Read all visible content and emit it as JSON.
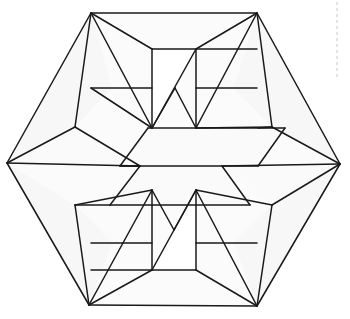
{
  "figure": {
    "type": "geometric-line-figure",
    "canvas": {
      "width": 350,
      "height": 319,
      "background": "#ffffff"
    },
    "stroke_color": "#1a1a1a",
    "stroke_width": 1.5,
    "fill_color": "#fbfbfb",
    "guide_color": "#c9c9c9",
    "outer_hexagon": [
      [
        91,
        13
      ],
      [
        257,
        13
      ],
      [
        340,
        164
      ],
      [
        257,
        306
      ],
      [
        89,
        305
      ],
      [
        7,
        163
      ]
    ],
    "center_band": [
      [
        120,
        166
      ],
      [
        148,
        128
      ],
      [
        285,
        128
      ],
      [
        258,
        166
      ],
      [
        222,
        166
      ],
      [
        250,
        205
      ],
      [
        110,
        205
      ],
      [
        140,
        166
      ]
    ],
    "guide_dashes": [
      {
        "x1": 337,
        "y1": 2,
        "x2": 337,
        "y2": 80
      }
    ],
    "faces": [
      {
        "id": "top-left-wing",
        "shade": "shade-a",
        "points": "91,13 7,163 75,127 112,88"
      },
      {
        "id": "top-right-wing",
        "shade": "shade-a",
        "points": "257,13 340,164 272,127 234,88"
      },
      {
        "id": "bottom-left-wing",
        "shade": "shade-a",
        "points": "89,305 7,163 75,205 112,243"
      },
      {
        "id": "bottom-right-wing",
        "shade": "shade-a",
        "points": "257,306 340,164 272,205 234,243"
      },
      {
        "id": "upper-center-band",
        "shade": "shade-b",
        "points": "148,128 285,128 258,166 120,166"
      },
      {
        "id": "lower-center-band",
        "shade": "shade-b",
        "points": "110,205 250,205 222,166 140,166"
      },
      {
        "id": "left-arrow",
        "shade": "shade-b",
        "points": "7,163 75,127 140,166"
      },
      {
        "id": "right-arrow",
        "shade": "shade-b",
        "points": "340,164 272,205 222,166"
      },
      {
        "id": "top-zig-left",
        "shade": "shade-c",
        "points": "152,49 152,128 196,49"
      },
      {
        "id": "bottom-zig-right",
        "shade": "shade-c",
        "points": "196,270 196,190 152,270"
      }
    ],
    "lines": [
      {
        "id": "outer-edge-nw",
        "d": "M 91,13 L 7,163"
      },
      {
        "id": "outer-edge-n",
        "d": "M 91,13 L 257,13"
      },
      {
        "id": "outer-edge-ne",
        "d": "M 257,13 L 340,164"
      },
      {
        "id": "outer-edge-se",
        "d": "M 340,164 L 257,306"
      },
      {
        "id": "outer-edge-s",
        "d": "M 257,306 L 89,305"
      },
      {
        "id": "outer-edge-sw",
        "d": "M 89,305 L 7,163"
      },
      {
        "id": "tl-fold-a",
        "d": "M 91,13 L 75,127"
      },
      {
        "id": "tl-fold-b",
        "d": "M 91,13 L 152,128"
      },
      {
        "id": "tl-fold-c",
        "d": "M 91,13 L 152,49"
      },
      {
        "id": "tl-shelf",
        "d": "M 91,88 L 152,88"
      },
      {
        "id": "tl-diag",
        "d": "M 91,88 L 152,128"
      },
      {
        "id": "left-arrow-top",
        "d": "M 7,163 L 75,127"
      },
      {
        "id": "left-arrow-bottom",
        "d": "M 75,127 L 140,166"
      },
      {
        "id": "left-mid-horizontal",
        "d": "M 7,163 L 140,166"
      },
      {
        "id": "tr-fold-a",
        "d": "M 257,13 L 272,127"
      },
      {
        "id": "tr-fold-b",
        "d": "M 257,13 L 196,128"
      },
      {
        "id": "tr-fold-c",
        "d": "M 257,13 L 196,49"
      },
      {
        "id": "tr-shelf",
        "d": "M 257,88 L 196,88"
      },
      {
        "id": "tr-diag",
        "d": "M 272,127 L 196,128"
      },
      {
        "id": "right-arrow-top",
        "d": "M 340,164 L 272,127"
      },
      {
        "id": "right-arrow-bot",
        "d": "M 340,164 L 272,205"
      },
      {
        "id": "right-mid-horizontal",
        "d": "M 340,164 L 222,166"
      },
      {
        "id": "bl-fold-a",
        "d": "M 89,305 L 75,205"
      },
      {
        "id": "bl-fold-b",
        "d": "M 89,305 L 152,190"
      },
      {
        "id": "bl-fold-c",
        "d": "M 89,305 L 152,270"
      },
      {
        "id": "bl-shelf",
        "d": "M 91,243 L 152,243"
      },
      {
        "id": "bl-diag",
        "d": "M 75,205 L 152,190"
      },
      {
        "id": "br-fold-a",
        "d": "M 257,306 L 272,205"
      },
      {
        "id": "br-fold-b",
        "d": "M 257,306 L 196,190"
      },
      {
        "id": "br-fold-c",
        "d": "M 257,306 L 196,270"
      },
      {
        "id": "br-shelf",
        "d": "M 257,243 L 196,243"
      },
      {
        "id": "br-diag",
        "d": "M 272,205 L 196,190"
      },
      {
        "id": "band-top-edge",
        "d": "M 148,128 L 285,128"
      },
      {
        "id": "band-bot-edge",
        "d": "M 110,205 L 250,205"
      },
      {
        "id": "band-mid-left",
        "d": "M 120,166 L 140,166"
      },
      {
        "id": "band-left-upper",
        "d": "M 148,128 L 120,166"
      },
      {
        "id": "band-left-lower",
        "d": "M 140,166 L 110,205"
      },
      {
        "id": "band-right-upper",
        "d": "M 285,128 L 258,166"
      },
      {
        "id": "band-right-lower",
        "d": "M 222,166 L 250,205"
      },
      {
        "id": "band-center-horizontal",
        "d": "M 120,166 L 258,166"
      },
      {
        "id": "zig-top-vert",
        "d": "M 152,49 L 152,128"
      },
      {
        "id": "zig-top-horiz",
        "d": "M 152,49 L 257,49"
      },
      {
        "id": "zig-top-peak1",
        "d": "M 152,128 L 196,49"
      },
      {
        "id": "zig-top-peak2",
        "d": "M 196,49 L 196,128"
      },
      {
        "id": "zig-top-valley",
        "d": "M 152,128 L 175,88"
      },
      {
        "id": "zig-top-valley2",
        "d": "M 175,88 L 196,128"
      },
      {
        "id": "zig-bot-vert",
        "d": "M 196,190 L 196,270"
      },
      {
        "id": "zig-bot-horiz",
        "d": "M 196,270 L 91,270"
      },
      {
        "id": "zig-bot-peak1",
        "d": "M 196,190 L 152,270"
      },
      {
        "id": "zig-bot-peak2",
        "d": "M 152,190 L 152,270"
      },
      {
        "id": "zig-bot-valley",
        "d": "M 152,190 L 174,230"
      },
      {
        "id": "zig-bot-valley2",
        "d": "M 174,230 L 196,190"
      },
      {
        "id": "left-low-notch-a",
        "d": "M 75,205 L 110,205"
      },
      {
        "id": "right-high-notch-a",
        "d": "M 272,127 L 258,128"
      }
    ]
  }
}
